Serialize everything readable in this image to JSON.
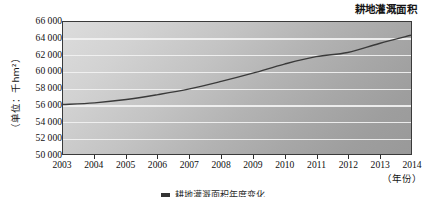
{
  "chart_data": {
    "type": "line",
    "title": "耕地灌溉面积",
    "xlabel": "（年份）",
    "ylabel": "（单位：千hm²）",
    "x": [
      2003,
      2004,
      2005,
      2006,
      2007,
      2008,
      2009,
      2010,
      2011,
      2012,
      2013,
      2014
    ],
    "values": [
      56000,
      56200,
      56600,
      57200,
      57900,
      58800,
      59800,
      60900,
      61800,
      62300,
      63400,
      64400
    ],
    "series": [
      {
        "name": "耕地灌溉面积",
        "values": [
          56000,
          56200,
          56600,
          57200,
          57900,
          58800,
          59800,
          60900,
          61800,
          62300,
          63400,
          64400
        ]
      }
    ],
    "xlim": [
      2003,
      2014
    ],
    "ylim": [
      50000,
      66000
    ],
    "ytick_labels": [
      "66 000",
      "64 000",
      "62 000",
      "60 000",
      "58 000",
      "56 000",
      "54 000",
      "52 000",
      "50 000"
    ],
    "ytick_values": [
      66000,
      64000,
      62000,
      60000,
      58000,
      56000,
      54000,
      52000,
      50000
    ],
    "xtick_labels": [
      "2003",
      "2004",
      "2005",
      "2006",
      "2007",
      "2008",
      "2009",
      "2010",
      "2011",
      "2012",
      "2013",
      "2014"
    ],
    "grid": "horizontal",
    "legend": "none",
    "line_color": "#3a3a3a",
    "plot_background_light": "#dcdcdc",
    "plot_background_dark": "#999999",
    "gridline_color": "#f2f2f2"
  },
  "caption": {
    "marker": "",
    "text": "耕地灌溉面积年度变化"
  }
}
